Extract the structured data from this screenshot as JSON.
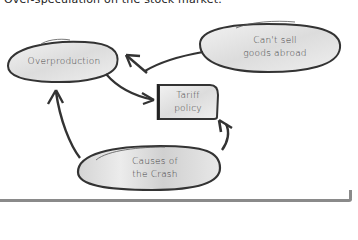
{
  "caption": "Over-speculation on the stock market.",
  "nodes": {
    "overproduction": {
      "label": "Overproduction",
      "shape": "ellipse"
    },
    "cant_sell": {
      "line1": "Can't sell",
      "line2": "goods abroad",
      "shape": "ellipse"
    },
    "tariff": {
      "line1": "Tariff",
      "line2": "policy",
      "shape": "rectangle"
    },
    "causes": {
      "line1": "Causes of",
      "line2": "the Crash",
      "shape": "ellipse"
    }
  },
  "edges": [
    {
      "from": "cant_sell",
      "to": "overproduction"
    },
    {
      "from": "overproduction",
      "to": "tariff"
    },
    {
      "from": "causes",
      "to": "overproduction"
    },
    {
      "from": "causes",
      "to": "tariff"
    }
  ],
  "colors": {
    "stroke": "#333333",
    "fill": "#e6e6e6",
    "text": "#444444",
    "rule": "#8a8a8a"
  }
}
